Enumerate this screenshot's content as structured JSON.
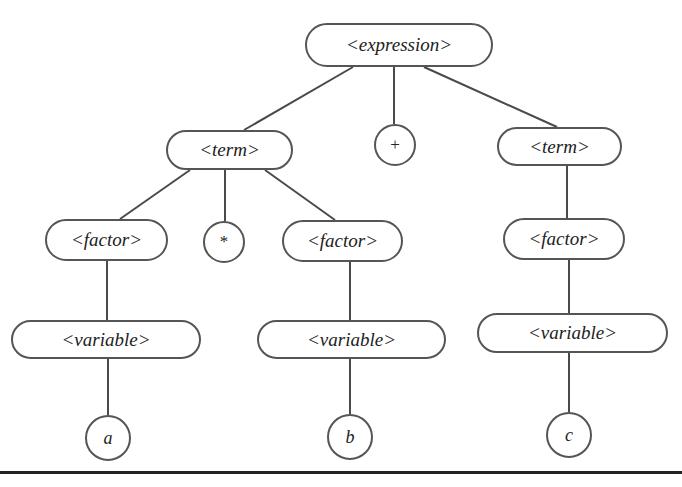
{
  "diagram": {
    "type": "parse-tree",
    "colors": {
      "stroke": "#555555",
      "edge": "#4a4a4a",
      "text": "#222222",
      "background": "#ffffff",
      "rule": "#222222"
    },
    "nodes": {
      "expression": {
        "label": "<expression>",
        "shape": "pill",
        "x": 305,
        "y": 23,
        "w": 188,
        "h": 44
      },
      "term_left": {
        "label": "<term>",
        "shape": "pill",
        "x": 166,
        "y": 130,
        "w": 127,
        "h": 40
      },
      "plus": {
        "label": "+",
        "shape": "circle",
        "x": 374,
        "y": 124,
        "w": 42,
        "h": 42
      },
      "term_right": {
        "label": "<term>",
        "shape": "pill",
        "x": 497,
        "y": 127,
        "w": 125,
        "h": 39
      },
      "factor_left": {
        "label": "<factor>",
        "shape": "pill",
        "x": 45,
        "y": 219,
        "w": 123,
        "h": 42
      },
      "star": {
        "label": "*",
        "shape": "circle",
        "x": 203,
        "y": 221,
        "w": 42,
        "h": 42
      },
      "factor_mid": {
        "label": "<factor>",
        "shape": "pill",
        "x": 282,
        "y": 220,
        "w": 121,
        "h": 42
      },
      "factor_right": {
        "label": "<factor>",
        "shape": "pill",
        "x": 503,
        "y": 218,
        "w": 122,
        "h": 42
      },
      "variable_left": {
        "label": "<variable>",
        "shape": "pill",
        "x": 11,
        "y": 320,
        "w": 190,
        "h": 39
      },
      "variable_mid": {
        "label": "<variable>",
        "shape": "pill",
        "x": 257,
        "y": 320,
        "w": 189,
        "h": 39
      },
      "variable_right": {
        "label": "<variable>",
        "shape": "pill",
        "x": 477,
        "y": 313,
        "w": 191,
        "h": 40
      },
      "leaf_a": {
        "label": "a",
        "shape": "circle",
        "x": 85,
        "y": 415,
        "w": 46,
        "h": 46
      },
      "leaf_b": {
        "label": "b",
        "shape": "circle",
        "x": 327,
        "y": 414,
        "w": 46,
        "h": 46
      },
      "leaf_c": {
        "label": "c",
        "shape": "circle",
        "x": 546,
        "y": 412,
        "w": 46,
        "h": 46
      }
    },
    "edges": [
      {
        "from": "expression",
        "to": "term_left",
        "x1": 353,
        "y1": 67,
        "x2": 244,
        "y2": 130
      },
      {
        "from": "expression",
        "to": "plus",
        "x1": 394,
        "y1": 67,
        "x2": 394,
        "y2": 124
      },
      {
        "from": "expression",
        "to": "term_right",
        "x1": 424,
        "y1": 67,
        "x2": 557,
        "y2": 127
      },
      {
        "from": "term_left",
        "to": "factor_left",
        "x1": 190,
        "y1": 170,
        "x2": 120,
        "y2": 219
      },
      {
        "from": "term_left",
        "to": "star",
        "x1": 225,
        "y1": 170,
        "x2": 225,
        "y2": 221
      },
      {
        "from": "term_left",
        "to": "factor_mid",
        "x1": 265,
        "y1": 170,
        "x2": 335,
        "y2": 220
      },
      {
        "from": "term_right",
        "to": "factor_right",
        "x1": 567,
        "y1": 166,
        "x2": 567,
        "y2": 218
      },
      {
        "from": "factor_left",
        "to": "variable_left",
        "x1": 107,
        "y1": 261,
        "x2": 107,
        "y2": 320
      },
      {
        "from": "factor_mid",
        "to": "variable_mid",
        "x1": 350,
        "y1": 262,
        "x2": 350,
        "y2": 320
      },
      {
        "from": "factor_right",
        "to": "variable_right",
        "x1": 569,
        "y1": 260,
        "x2": 569,
        "y2": 313
      },
      {
        "from": "variable_left",
        "to": "leaf_a",
        "x1": 108,
        "y1": 359,
        "x2": 108,
        "y2": 415
      },
      {
        "from": "variable_mid",
        "to": "leaf_b",
        "x1": 350,
        "y1": 359,
        "x2": 350,
        "y2": 414
      },
      {
        "from": "variable_right",
        "to": "leaf_c",
        "x1": 569,
        "y1": 353,
        "x2": 569,
        "y2": 412
      }
    ]
  }
}
